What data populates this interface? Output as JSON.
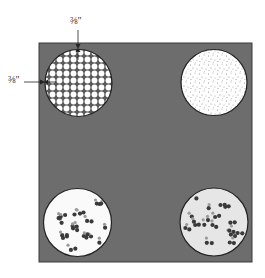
{
  "diagram": {
    "title": "",
    "background_color": "#ffffff",
    "square": {
      "color": "#6d6d6d",
      "border_color": "#3a3a3a",
      "x": 39,
      "y": 43,
      "width": 213,
      "height": 219
    },
    "dimension_labels": {
      "top": "⅜\"",
      "left": "⅜\""
    },
    "circles": [
      {
        "id": "top-left",
        "pattern": "white-dots-grid",
        "cx": 78.5,
        "cy": 83,
        "r": 33.5,
        "fill": "#ffffff",
        "dot_color": "#ffffff",
        "grid_color": "#5a5a5a"
      },
      {
        "id": "top-right",
        "pattern": "fine-stipple",
        "cx": 214,
        "cy": 82.5,
        "r": 33,
        "fill": "#ffffff",
        "dot_color": "#8a8a8a"
      },
      {
        "id": "bottom-left",
        "pattern": "scattered-dot-clusters",
        "cx": 77.5,
        "cy": 222.5,
        "r": 34,
        "fill": "#fafafa",
        "dot_color": "#3a3a3a",
        "accent_color": "#9a9a9a"
      },
      {
        "id": "bottom-right",
        "pattern": "scattered-dot-clusters",
        "cx": 214,
        "cy": 222,
        "r": 34,
        "fill": "#e6e6e6",
        "dot_color": "#3a3a3a",
        "accent_color": "#9a9a9a"
      }
    ]
  }
}
